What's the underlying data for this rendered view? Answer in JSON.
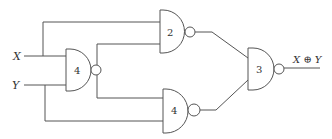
{
  "diagram": {
    "title": "",
    "inputs": [
      {
        "id": "x",
        "label": "X"
      },
      {
        "id": "y",
        "label": "Y"
      }
    ],
    "output": {
      "label": "X ⊕ Y"
    },
    "gates": [
      {
        "id": "g_left",
        "type": "NAND",
        "number": "4"
      },
      {
        "id": "g_top",
        "type": "NAND",
        "number": "2"
      },
      {
        "id": "g_bottom",
        "type": "NAND",
        "number": "4"
      },
      {
        "id": "g_out",
        "type": "NAND",
        "number": "3"
      }
    ],
    "colors": {
      "stroke": "#555555",
      "background": "#ffffff",
      "text": "#333333"
    }
  }
}
